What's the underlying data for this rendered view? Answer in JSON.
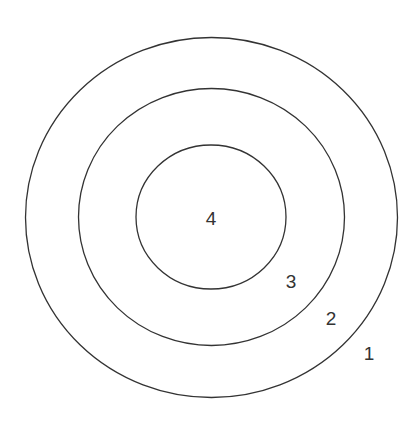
{
  "diagram": {
    "type": "concentric-circles",
    "stroke_color": "#333333",
    "background": "#ffffff",
    "rings": [
      {
        "label": "1",
        "cx": 211.5,
        "cy": 217.5,
        "rx": 186,
        "ry": 180,
        "label_x": 369,
        "label_y": 360
      },
      {
        "label": "2",
        "cx": 211.5,
        "cy": 217,
        "rx": 133,
        "ry": 128.5,
        "label_x": 331,
        "label_y": 325
      },
      {
        "label": "3",
        "cx": 211,
        "cy": 217,
        "rx": 75,
        "ry": 72,
        "label_x": 291,
        "label_y": 288
      },
      {
        "label": "4",
        "label_x": 211,
        "label_y": 225
      }
    ]
  }
}
